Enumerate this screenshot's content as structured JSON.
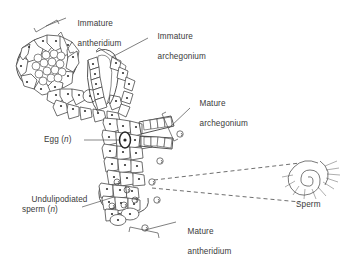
{
  "figure": {
    "type": "biological-diagram",
    "background_color": "#ffffff",
    "ink_color": "#3a3a3a",
    "label_color": "#3a3a3a"
  },
  "labels": {
    "immature_antheridium": {
      "line1": "Immature",
      "line2": "antheridium",
      "x": 68,
      "y": 10,
      "connector": "bracket"
    },
    "immature_archegonium": {
      "line1": "Immature",
      "line2": "archegonium",
      "x": 140,
      "y": 22,
      "connector": "bracket"
    },
    "mature_archegonium": {
      "line1": "Mature",
      "line2": "archegonium",
      "x": 187,
      "y": 90,
      "connector": "bracket"
    },
    "egg": {
      "text": "Egg (",
      "italic": "n",
      "text_end": ")",
      "x": 44,
      "y": 135,
      "connector": "leader-line"
    },
    "undulipodiated_sperm": {
      "line1": "Undulipodiated",
      "line2_start": "sperm (",
      "line2_italic": "n",
      "line2_end": ")",
      "x": 24,
      "y": 186,
      "connector": "leader-line"
    },
    "mature_antheridium": {
      "line1": "Mature",
      "line2": "antheridium",
      "x": 173,
      "y": 218,
      "connector": "bracket"
    },
    "sperm": {
      "text": "Sperm",
      "x": 295,
      "y": 198,
      "connector": "dashed-magnifier-lines"
    }
  },
  "structures": {
    "immature_antheridium": {
      "shape": "oval cell cluster",
      "cx": 46,
      "cy": 62
    },
    "immature_archegonium": {
      "shape": "elongated neck with canal",
      "cx": 100,
      "cy": 78
    },
    "mature_archegonium": {
      "shape": "two open necks",
      "cx": 152,
      "cy": 130
    },
    "mature_antheridium": {
      "shape": "cell mass releasing sperm",
      "cx": 120,
      "cy": 205
    },
    "egg_cell": {
      "shape": "dark-outlined cell",
      "cx": 125,
      "cy": 140
    },
    "free_sperm_count": 6,
    "sperm_detail": {
      "shape": "coiled spiral with flagella",
      "cx": 310,
      "cy": 178
    }
  }
}
